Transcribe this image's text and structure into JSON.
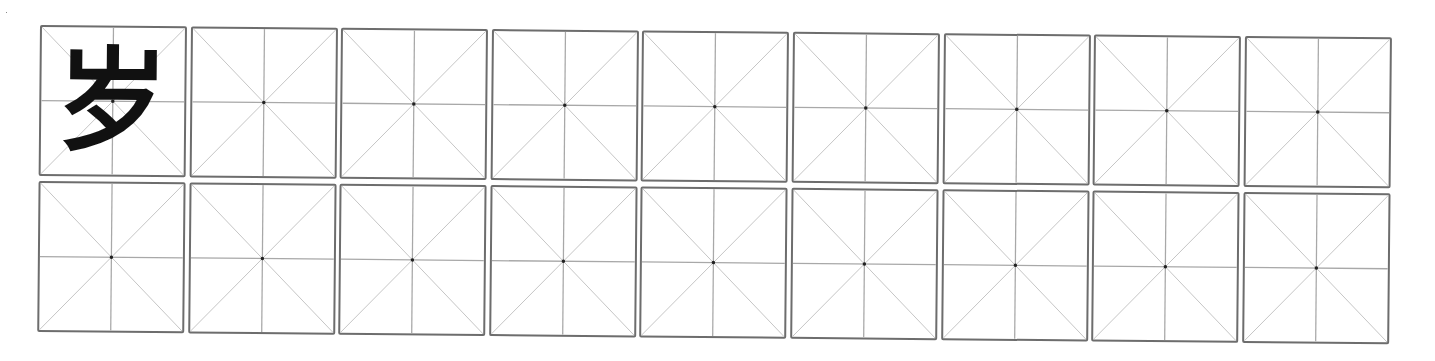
{
  "worksheet": {
    "type": "米字格 practice grid",
    "rows": 2,
    "columns": 9,
    "example_character": "岁",
    "colors": {
      "border": "#6d6d6d",
      "guide_lines": "#a8a8a8",
      "diagonal_lines": "#c4c4c4",
      "center_dot": "#222222",
      "character": "#111111"
    }
  }
}
